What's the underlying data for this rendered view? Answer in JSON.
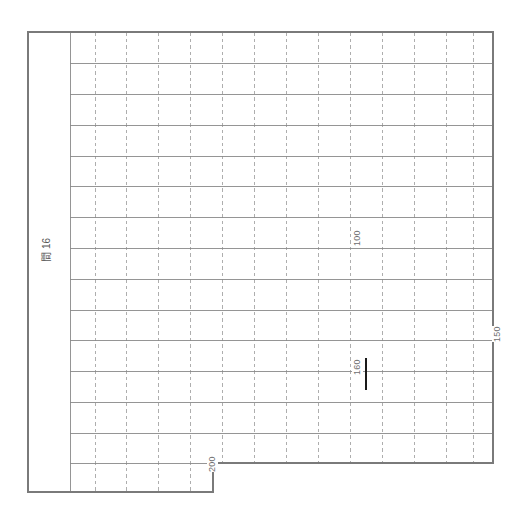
{
  "drawing": {
    "title": "Grid Framing Plan",
    "units": "mm",
    "span_label": {
      "symbol": "間",
      "count": "16"
    },
    "dimensions": [
      {
        "id": "dim-100",
        "value": "100",
        "x": 352,
        "y": 246,
        "rotated": true
      },
      {
        "id": "dim-160",
        "value": "160",
        "x": 352,
        "y": 375,
        "rotated": true
      },
      {
        "id": "dim-200",
        "value": "200",
        "x": 207,
        "y": 472,
        "rotated": true
      },
      {
        "id": "dim-150",
        "value": "150",
        "x": 492,
        "y": 342,
        "rotated": true
      }
    ],
    "grid": {
      "left": 28,
      "top": 32,
      "right": 493,
      "bottom": 492,
      "inner_left": 70,
      "step_x": 213,
      "step_y": 463,
      "row_count": 14,
      "row_pitch": 30.8,
      "col_pitch": 32,
      "col_count": 14,
      "line_color": "#8a8a8a",
      "dash_color": "#9a9a9a",
      "accent_color": "#1a1a1a",
      "background": "#ffffff"
    },
    "accent_mark": {
      "id": "tick-160",
      "x": 366,
      "y_top": 358,
      "y_bottom": 390
    }
  }
}
